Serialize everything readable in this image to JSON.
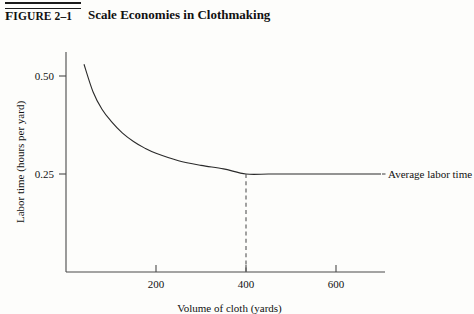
{
  "figure": {
    "number_prefix": "F",
    "number_rest": "IGURE",
    "number_value": "2–1",
    "title": "Scale Economies in Clothmaking"
  },
  "chart_data": {
    "type": "line",
    "title": "Scale Economies in Clothmaking",
    "xlabel": "Volume of cloth (yards)",
    "ylabel": "Labor time (hours per yard)",
    "xlim": [
      0,
      710
    ],
    "ylim": [
      0,
      0.6
    ],
    "grid": false,
    "legend": "none",
    "xticks": [
      200,
      400,
      600
    ],
    "xtick_labels": [
      "200",
      "400",
      "600"
    ],
    "yticks": [
      0.25,
      0.5
    ],
    "ytick_labels": [
      "0.25",
      "0.50"
    ],
    "series": [
      {
        "name": "Average labor time",
        "annotation": "Average labor time",
        "x": [
          40,
          60,
          80,
          100,
          125,
          150,
          175,
          200,
          250,
          300,
          350,
          400,
          450,
          500,
          550,
          600,
          650,
          700
        ],
        "y": [
          0.53,
          0.46,
          0.415,
          0.385,
          0.355,
          0.333,
          0.316,
          0.303,
          0.284,
          0.272,
          0.263,
          0.25,
          0.25,
          0.25,
          0.25,
          0.25,
          0.25,
          0.25
        ]
      }
    ],
    "annotations": [
      {
        "name": "minimum-efficient-scale-dropline",
        "type": "vertical-dashed",
        "x": 400,
        "y_from": 0.25,
        "y_to": 0.0,
        "label": ""
      }
    ],
    "asymptote": 0.25,
    "minimum_efficient_scale": 400
  }
}
